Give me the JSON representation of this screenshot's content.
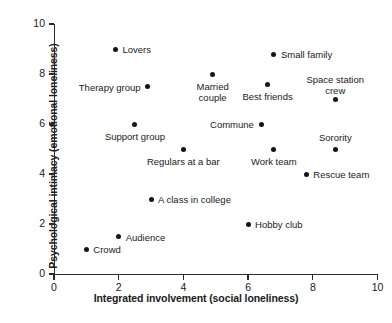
{
  "chart_data": {
    "type": "scatter",
    "title": "",
    "xlabel": "Integrated involvement (social loneliness)",
    "ylabel": "Psychological intimacy (emotional loneliness)",
    "xlim": [
      0,
      10
    ],
    "ylim": [
      0,
      10
    ],
    "xticks": [
      "0",
      "2",
      "4",
      "6",
      "8",
      "10"
    ],
    "xtick_values": [
      0,
      2,
      4,
      6,
      8,
      10
    ],
    "yticks": [
      "0",
      "2",
      "4",
      "6",
      "8",
      "10"
    ],
    "ytick_values": [
      0,
      2,
      4,
      6,
      8,
      10
    ],
    "grid": false,
    "legend": "none",
    "points": [
      {
        "label": "Lovers",
        "x": 1.9,
        "y": 9.0,
        "anchor": "right",
        "dx": 7,
        "dy": -4
      },
      {
        "label": "Small family",
        "x": 6.8,
        "y": 8.8,
        "anchor": "right",
        "dx": 7,
        "dy": -4
      },
      {
        "label": "Married\ncouple",
        "x": 4.9,
        "y": 8.0,
        "anchor": "center",
        "dx": 0,
        "dy": 8
      },
      {
        "label": "Therapy group",
        "x": 2.9,
        "y": 7.5,
        "anchor": "left",
        "dx": -7,
        "dy": -4
      },
      {
        "label": "Best friends",
        "x": 6.6,
        "y": 7.6,
        "anchor": "center",
        "dx": 0,
        "dy": 8
      },
      {
        "label": "Space station\ncrew",
        "x": 8.7,
        "y": 7.0,
        "anchor": "center",
        "dx": 0,
        "dy": -24
      },
      {
        "label": "Commune",
        "x": 6.4,
        "y": 6.0,
        "anchor": "left",
        "dx": -7,
        "dy": -4
      },
      {
        "label": "Support group",
        "x": 2.5,
        "y": 6.0,
        "anchor": "center",
        "dx": 0,
        "dy": 8
      },
      {
        "label": "Sorority",
        "x": 8.7,
        "y": 5.0,
        "anchor": "center",
        "dx": 0,
        "dy": -16
      },
      {
        "label": "Regulars at a bar",
        "x": 4.0,
        "y": 5.0,
        "anchor": "center",
        "dx": 0,
        "dy": 8
      },
      {
        "label": "Work team",
        "x": 6.8,
        "y": 5.0,
        "anchor": "center",
        "dx": 0,
        "dy": 8
      },
      {
        "label": "Rescue team",
        "x": 7.8,
        "y": 4.0,
        "anchor": "right",
        "dx": 7,
        "dy": -4
      },
      {
        "label": "A class in college",
        "x": 3.0,
        "y": 3.0,
        "anchor": "right",
        "dx": 7,
        "dy": -4
      },
      {
        "label": "Hobby club",
        "x": 6.0,
        "y": 2.0,
        "anchor": "right",
        "dx": 7,
        "dy": -4
      },
      {
        "label": "Audience",
        "x": 2.0,
        "y": 1.5,
        "anchor": "right",
        "dx": 7,
        "dy": -4
      },
      {
        "label": "Crowd",
        "x": 1.0,
        "y": 1.0,
        "anchor": "right",
        "dx": 7,
        "dy": -4
      }
    ]
  }
}
